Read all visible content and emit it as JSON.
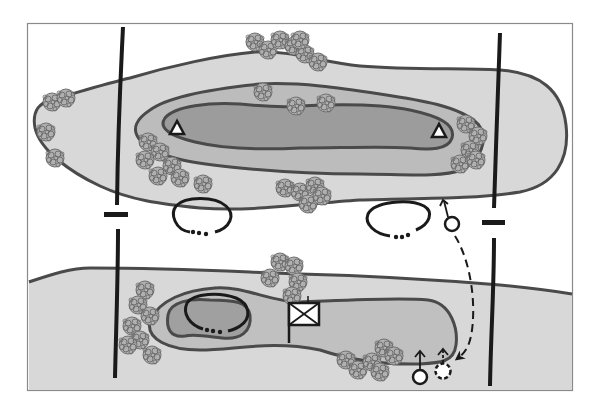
{
  "diagram": {
    "type": "tactical-terrain-sketch",
    "frame": {
      "x": 27,
      "y": 23,
      "width": 546,
      "height": 368
    },
    "colors": {
      "background": "#ffffff",
      "frame_border": "#8a8a8a",
      "terrain_light": "#d8d8d8",
      "terrain_mid": "#b9b9b9",
      "terrain_dark": "#9a9a9a",
      "contour_line": "#4a4a4a",
      "boundary_line": "#1a1a1a",
      "tree_fill": "#a9a9a9",
      "tree_stroke": "#6a6a6a",
      "symbol_fill": "#ffffff",
      "symbol_stroke": "#1a1a1a"
    },
    "upper_hill": {
      "levels": [
        "outer-contour",
        "middle-contour",
        "summit-contour"
      ],
      "observation_posts": [
        {
          "name": "observation-post-left",
          "x": 177,
          "y": 128
        },
        {
          "name": "observation-post-right",
          "x": 439,
          "y": 131
        }
      ]
    },
    "lower_hill": {
      "levels": [
        "ridge-band",
        "inner-ridge",
        "depression"
      ],
      "unit_symbol": {
        "name": "infantry-unit-flag",
        "x": 289,
        "y": 303,
        "width": 30,
        "height": 22
      }
    },
    "boundaries": [
      {
        "name": "boundary-line-left",
        "x": 117
      },
      {
        "name": "boundary-line-right",
        "x": 497
      }
    ],
    "boundary_ticks": [
      {
        "name": "boundary-tick-left",
        "x": 103,
        "y": 214
      },
      {
        "name": "boundary-tick-right",
        "x": 481,
        "y": 221
      }
    ],
    "engagement_areas": [
      {
        "name": "engagement-area-left",
        "cx": 202,
        "cy": 219
      },
      {
        "name": "engagement-area-right",
        "cx": 405,
        "cy": 217
      },
      {
        "name": "engagement-area-lower",
        "cx": 218,
        "cy": 311
      }
    ],
    "positions": [
      {
        "name": "position-primary-upper",
        "x": 452,
        "y": 223,
        "style": "solid"
      },
      {
        "name": "position-primary-lower",
        "x": 420,
        "y": 377,
        "style": "solid"
      },
      {
        "name": "position-alternate-lower",
        "x": 443,
        "y": 374,
        "style": "dashed"
      }
    ],
    "movement": {
      "name": "displacement-route",
      "from": "position-primary-upper",
      "to": "position-alternate-lower",
      "style": "dashed-arrow"
    }
  }
}
